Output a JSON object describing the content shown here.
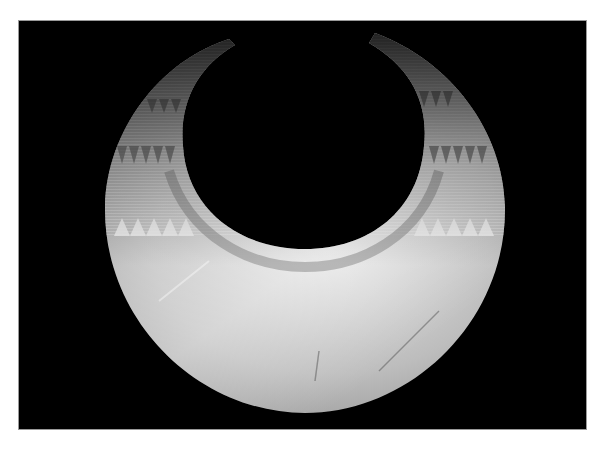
{
  "image": {
    "subject": "Gold lunula (crescent-shaped collar) photographed on black background",
    "background_color": "#000000",
    "page_color": "#ffffff",
    "metal_tones": [
      "#f0f0f0",
      "#c8c8c8",
      "#9a9a9a",
      "#5a5a5a"
    ],
    "decoration": [
      "incised triangle bands",
      "horizontal line bands",
      "zig-zag border along inner edge"
    ]
  },
  "caption": {
    "text": ""
  }
}
